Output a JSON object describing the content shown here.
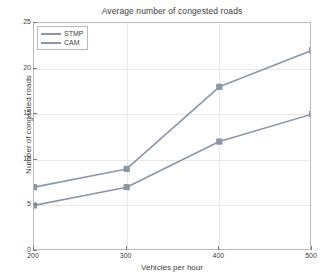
{
  "chart_data": {
    "type": "line",
    "title": "Average number of congested roads",
    "xlabel": "Vehicles per hour",
    "ylabel": "Number of congested roads",
    "x": [
      200,
      300,
      400,
      500
    ],
    "xticklabels": [
      "200",
      "300",
      "400",
      "500"
    ],
    "yticks": [
      0,
      5,
      10,
      15,
      20,
      25
    ],
    "yticklabels": [
      "0",
      "5",
      "10",
      "15",
      "20",
      "25"
    ],
    "xlim": [
      200,
      500
    ],
    "ylim": [
      0,
      25
    ],
    "grid": true,
    "legend_position": "upper left",
    "marker": "square",
    "series": [
      {
        "name": "STMP",
        "values": [
          7,
          9,
          18,
          22
        ],
        "color": "#8b96a6"
      },
      {
        "name": "CAM",
        "values": [
          5,
          7,
          12,
          15
        ],
        "color": "#8b96a6"
      }
    ]
  }
}
